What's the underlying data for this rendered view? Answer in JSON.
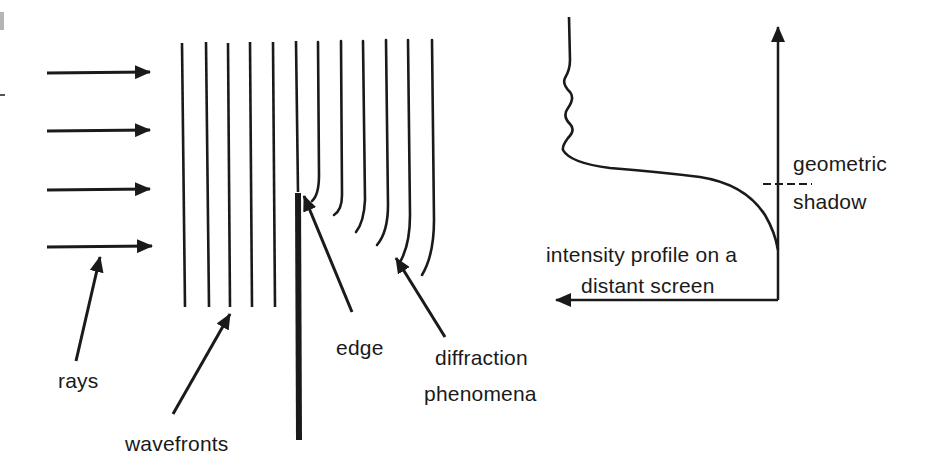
{
  "diagram": {
    "colors": {
      "ink": "#1a1a1a",
      "background": "#ffffff",
      "scan_artifact": "#9a9a9a"
    },
    "left_panel": {
      "rays": {
        "count": 4,
        "direction": "right",
        "label": "rays"
      },
      "wavefronts": {
        "straight_count": 6,
        "bent_count": 6,
        "label": "wavefronts"
      },
      "edge": {
        "label": "edge"
      },
      "diffraction": {
        "label_line1": "diffraction",
        "label_line2": "phenomena"
      }
    },
    "right_panel": {
      "axis_vertical": "position on screen",
      "axis_horizontal": "intensity",
      "geometric_shadow": {
        "label_line1": "geometric",
        "label_line2": "shadow"
      },
      "profile_label": {
        "line1": "intensity profile on a",
        "line2": "distant screen"
      }
    }
  }
}
